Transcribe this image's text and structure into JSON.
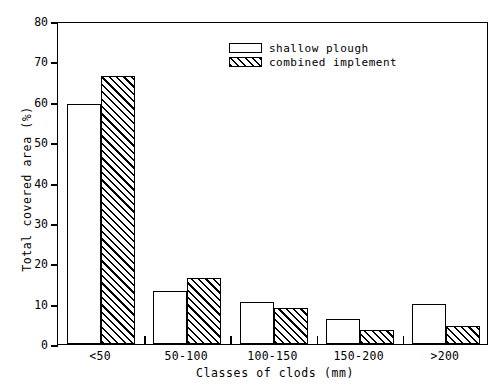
{
  "chart_data": {
    "type": "bar",
    "title": "",
    "xlabel": "Classes of clods (mm)",
    "ylabel": "Total covered area (%)",
    "categories": [
      "<50",
      "50-100",
      "100-150",
      "150-200",
      ">200"
    ],
    "series": [
      {
        "name": "shallow plough",
        "values": [
          59.5,
          13.2,
          10.5,
          6.2,
          10.0
        ],
        "fill": "white"
      },
      {
        "name": "combined implement",
        "values": [
          66.5,
          16.4,
          8.8,
          3.4,
          4.4
        ],
        "fill": "hatched-45"
      }
    ],
    "ylim": [
      0,
      80
    ],
    "yticks": [
      0,
      10,
      20,
      30,
      40,
      50,
      60,
      70,
      80
    ],
    "ytick_labels": [
      "0",
      "10",
      "20",
      "30",
      "40",
      "50",
      "60",
      "70",
      "80"
    ],
    "grid": false,
    "legend_position": "top-center",
    "axis_color": "#000000",
    "background": "#ffffff"
  },
  "legend": {
    "entries": [
      {
        "label": "shallow plough"
      },
      {
        "label": "combined implement"
      }
    ]
  }
}
